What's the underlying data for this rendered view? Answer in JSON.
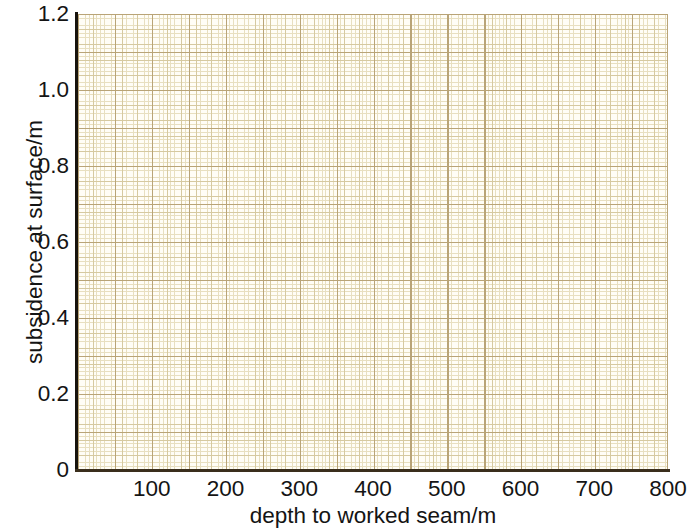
{
  "chart_data": {
    "type": "scatter",
    "title": "",
    "subtitle": "",
    "xlabel": "depth to worked seam/m",
    "ylabel": "subsidence at surface/m",
    "xlim": [
      0,
      800
    ],
    "ylim": [
      0,
      1.2
    ],
    "x_ticks": [
      100,
      200,
      300,
      400,
      500,
      600,
      700,
      800
    ],
    "x_tick_labels": [
      "100",
      "200",
      "300",
      "400",
      "500",
      "600",
      "700",
      "800"
    ],
    "y_ticks": [
      0,
      0.2,
      0.4,
      0.6,
      0.8,
      1.0,
      1.2
    ],
    "y_tick_labels": [
      "0",
      "0.2",
      "0.4",
      "0.6",
      "0.8",
      "1.0",
      "1.2"
    ],
    "grid": "graph-paper",
    "grid_minor_step_x": 10,
    "grid_minor_step_y": 0.005,
    "grid_major_step_x": 50,
    "grid_major_step_y": 0.05,
    "legend": null,
    "legend_position": "none",
    "annotations": [],
    "series": [],
    "values": [],
    "categories": [],
    "note": "blank graph paper grid, no data plotted"
  },
  "axes": {
    "x": {
      "label": "depth to worked seam/m",
      "ticks": [
        {
          "value": 100,
          "label": "100"
        },
        {
          "value": 200,
          "label": "200"
        },
        {
          "value": 300,
          "label": "300"
        },
        {
          "value": 400,
          "label": "400"
        },
        {
          "value": 500,
          "label": "500"
        },
        {
          "value": 600,
          "label": "600"
        },
        {
          "value": 700,
          "label": "700"
        },
        {
          "value": 800,
          "label": "800"
        }
      ]
    },
    "y": {
      "label": "subsidence at surface/m",
      "ticks": [
        {
          "value": 0,
          "label": "0"
        },
        {
          "value": 0.2,
          "label": "0.2"
        },
        {
          "value": 0.4,
          "label": "0.4"
        },
        {
          "value": 0.6,
          "label": "0.6"
        },
        {
          "value": 0.8,
          "label": "0.8"
        },
        {
          "value": 1.0,
          "label": "1.0"
        },
        {
          "value": 1.2,
          "label": "1.2"
        }
      ]
    }
  },
  "colors": {
    "paper": "#fffdf6",
    "grid_fine": "#e8dfc0",
    "grid_medium": "#d6c9a0",
    "grid_major": "#b9a477",
    "axis_spine": "#17130d",
    "axis_spine_x": "#3a2e1c",
    "text": "#141414",
    "background": "#ffffff"
  }
}
